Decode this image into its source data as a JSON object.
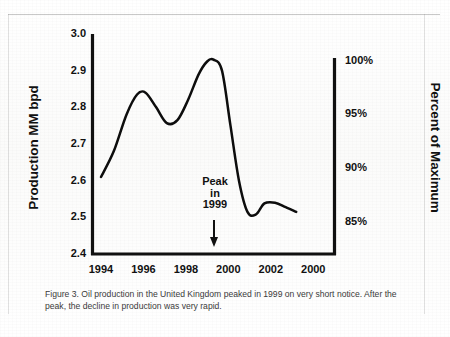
{
  "figure": {
    "caption": "Figure 3.  Oil production in the United Kingdom peaked in 1999 on very short notice.  After the peak, the decline in production was very rapid."
  },
  "chart_data": {
    "type": "line",
    "title": "",
    "xlabel": "",
    "ylabel": "Production MM bpd",
    "y2label": "Percent of Maximum",
    "xlim": [
      1993.6,
      2005.0
    ],
    "ylim": [
      2.4,
      3.0
    ],
    "y2lim": [
      82.0,
      102.5
    ],
    "grid": false,
    "legend": null,
    "xticks": [
      "1994",
      "1996",
      "1998",
      "2000",
      "2002",
      "2000"
    ],
    "xtick_values": [
      1994,
      1996,
      1998,
      2000,
      2002,
      2004
    ],
    "yticks": [
      "3.0",
      "2.9",
      "2.8",
      "2.7",
      "2.6",
      "2.5",
      "2.4"
    ],
    "ytick_values": [
      3.0,
      2.9,
      2.8,
      2.7,
      2.6,
      2.5,
      2.4
    ],
    "y2ticks": [
      "100%",
      "95%",
      "90%",
      "85%"
    ],
    "y2tick_values": [
      100,
      95,
      90,
      85
    ],
    "series": [
      {
        "name": "UK oil production",
        "x": [
          1994.0,
          1994.6,
          1995.2,
          1995.7,
          1996.1,
          1996.6,
          1997.1,
          1997.6,
          1998.1,
          1998.6,
          1999.0,
          1999.3,
          1999.7,
          2000.1,
          2000.5,
          2000.9,
          2001.3,
          2001.7,
          2002.2,
          2002.7,
          2003.2
        ],
        "y": [
          2.61,
          2.68,
          2.78,
          2.835,
          2.84,
          2.8,
          2.757,
          2.765,
          2.82,
          2.89,
          2.925,
          2.93,
          2.9,
          2.75,
          2.6,
          2.515,
          2.508,
          2.538,
          2.54,
          2.528,
          2.515
        ]
      }
    ],
    "annotations": [
      {
        "name": "peak-annotation",
        "lines": [
          "Peak",
          "in",
          "1999"
        ],
        "arrow": "down",
        "x": 1999.0
      }
    ]
  }
}
